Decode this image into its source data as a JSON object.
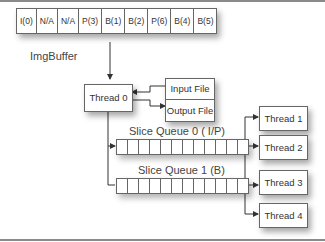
{
  "img_buffer": {
    "label": "ImgBuffer",
    "cells": [
      "I(0)",
      "N/A",
      "N/A",
      "P(3)",
      "B(1)",
      "B(2)",
      "P(6)",
      "B(4)",
      "B(5)"
    ]
  },
  "thread0": {
    "label": "Thread 0"
  },
  "files": {
    "input": "Input File",
    "output": "Output File"
  },
  "queues": [
    {
      "label": "Slice Queue 0 ( I/P)",
      "cells": 12
    },
    {
      "label": "Slice Queue 1 (B)",
      "cells": 12
    }
  ],
  "threads": [
    {
      "label": "Thread 1"
    },
    {
      "label": "Thread 2"
    },
    {
      "label": "Thread 3"
    },
    {
      "label": "Thread 4"
    }
  ]
}
